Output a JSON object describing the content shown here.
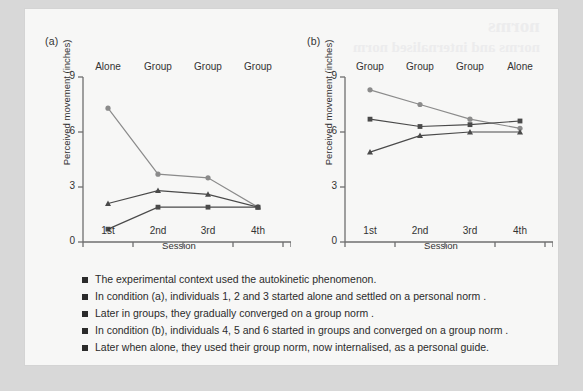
{
  "bleed_text": {
    "title": "norms",
    "subtitle": "norms and internalised norm"
  },
  "charts": [
    {
      "panel_label": "(a)",
      "conditions": [
        "Alone",
        "Group",
        "Group",
        "Group"
      ],
      "chart_data": {
        "type": "line",
        "title": "(a)",
        "xlabel": "Session",
        "ylabel": "Perceived movement (inches)",
        "categories": [
          "1st",
          "2nd",
          "3rd",
          "4th"
        ],
        "ylim": [
          0,
          9
        ],
        "yticks": [
          0,
          3,
          6,
          9
        ],
        "grid": false,
        "legend": "none",
        "condition_labels": [
          "Alone",
          "Group",
          "Group",
          "Group"
        ],
        "series": [
          {
            "name": "Individual 1",
            "marker": "circle",
            "color": "#8b8b8b",
            "values": [
              7.3,
              3.7,
              3.5,
              1.9
            ]
          },
          {
            "name": "Individual 2",
            "marker": "triangle",
            "color": "#4a4a4a",
            "values": [
              2.1,
              2.8,
              2.6,
              1.9
            ]
          },
          {
            "name": "Individual 3",
            "marker": "square",
            "color": "#4a4a4a",
            "values": [
              0.7,
              1.9,
              1.9,
              1.9
            ]
          }
        ]
      }
    },
    {
      "panel_label": "(b)",
      "conditions": [
        "Group",
        "Group",
        "Group",
        "Alone"
      ],
      "chart_data": {
        "type": "line",
        "title": "(b)",
        "xlabel": "Session",
        "ylabel": "Perceived movement (inches)",
        "categories": [
          "1st",
          "2nd",
          "3rd",
          "4th"
        ],
        "ylim": [
          0,
          9
        ],
        "yticks": [
          0,
          3,
          6,
          9
        ],
        "grid": false,
        "legend": "none",
        "condition_labels": [
          "Group",
          "Group",
          "Group",
          "Alone"
        ],
        "series": [
          {
            "name": "Individual 4",
            "marker": "circle",
            "color": "#8b8b8b",
            "values": [
              8.3,
              7.5,
              6.7,
              6.2
            ]
          },
          {
            "name": "Individual 5",
            "marker": "square",
            "color": "#4a4a4a",
            "values": [
              6.7,
              6.3,
              6.4,
              6.6
            ]
          },
          {
            "name": "Individual 6",
            "marker": "triangle",
            "color": "#4a4a4a",
            "values": [
              4.9,
              5.8,
              6.0,
              6.0
            ]
          }
        ]
      }
    }
  ],
  "legend_notes": [
    "The experimental context used the autokinetic phenomenon.",
    "In condition (a), individuals 1, 2 and 3 started alone and settled on a personal norm .",
    "Later in groups, they gradually converged on a group norm  .",
    "In condition (b), individuals 4, 5 and 6 started in groups and converged on a group norm  .",
    "Later when alone, they used their group norm, now internalised, as a personal guide."
  ]
}
